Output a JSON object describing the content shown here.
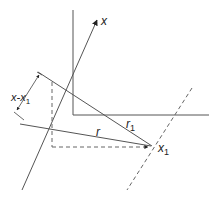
{
  "diagram": {
    "labels": {
      "axis_x": "x",
      "distance": "x-x",
      "distance_sub": "1",
      "r": "r",
      "r1": "r",
      "r1_sub": "1",
      "point": "x",
      "point_sub": "1"
    },
    "colors": {
      "line": "#555555",
      "text": "#222222",
      "background": "#ffffff"
    }
  }
}
